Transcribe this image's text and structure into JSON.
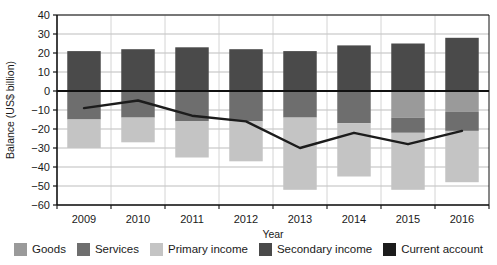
{
  "chart_data": {
    "type": "bar",
    "title": "",
    "xlabel": "Year",
    "ylabel": "Balance (US$ billion)",
    "categories": [
      "2009",
      "2010",
      "2011",
      "2012",
      "2013",
      "2014",
      "2015",
      "2016"
    ],
    "ylim": [
      -60,
      40
    ],
    "yticks": [
      40,
      30,
      20,
      10,
      0,
      -10,
      -20,
      -30,
      -40,
      -50,
      -60
    ],
    "ytick_labels": [
      "40",
      "30",
      "20",
      "10",
      "0",
      "−10",
      "−20",
      "−30",
      "−40",
      "−50",
      "−60"
    ],
    "grid": true,
    "legend_position": "bottom",
    "stacked": true,
    "series": [
      {
        "name": "Goods",
        "type": "bar",
        "color": "#9a9a9a",
        "values": [
          0,
          0,
          0,
          0,
          0,
          0,
          -14,
          -11
        ]
      },
      {
        "name": "Services",
        "type": "bar",
        "color": "#6e6e6e",
        "values": [
          -15,
          -14,
          -16,
          -16,
          -14,
          -17,
          -8,
          -10
        ]
      },
      {
        "name": "Primary income",
        "type": "bar",
        "color": "#c4c4c4",
        "values": [
          -15,
          -13,
          -19,
          -21,
          -38,
          -28,
          -30,
          -27
        ]
      },
      {
        "name": "Secondary income",
        "type": "bar",
        "color": "#4a4a4a",
        "values": [
          21,
          22,
          23,
          22,
          21,
          24,
          25,
          28
        ]
      },
      {
        "name": "Current account",
        "type": "line",
        "color": "#1c1c1c",
        "values": [
          -9,
          -5,
          -13,
          -16,
          -30,
          -22,
          -28,
          -21
        ]
      }
    ],
    "stack_order_negative": [
      "Goods",
      "Services",
      "Primary income"
    ],
    "bar_totals_negative": [
      -30,
      -27,
      -35,
      -37,
      -52,
      -45,
      -52,
      -48
    ]
  },
  "legend": {
    "items": [
      {
        "label": "Goods",
        "color": "#9a9a9a"
      },
      {
        "label": "Services",
        "color": "#6e6e6e"
      },
      {
        "label": "Primary income",
        "color": "#c4c4c4"
      },
      {
        "label": "Secondary income",
        "color": "#4a4a4a"
      },
      {
        "label": "Current account",
        "color": "#1c1c1c"
      }
    ]
  },
  "axes": {
    "y_title": "Balance (US$ billion)",
    "x_title": "Year"
  }
}
